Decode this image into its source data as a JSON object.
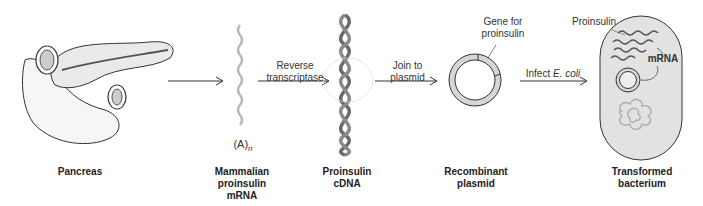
{
  "stages": [
    {
      "id": "pancreas",
      "label": "Pancreas"
    },
    {
      "id": "mrna",
      "label_lines": [
        "Mammalian",
        "proinsulin",
        "mRNA"
      ],
      "tail_label": "(A)",
      "tail_subscript": "n"
    },
    {
      "id": "cdna",
      "label_lines": [
        "Proinsulin",
        "cDNA"
      ]
    },
    {
      "id": "plasmid",
      "label_lines": [
        "Recombinant",
        "plasmid"
      ],
      "callout_lines": [
        "Gene for",
        "proinsulin"
      ]
    },
    {
      "id": "bacterium",
      "label_lines": [
        "Transformed",
        "bacterium"
      ],
      "callout_proinsulin": "Proinsulin",
      "callout_mrna": "mRNA"
    }
  ],
  "arrows": [
    {
      "from": "pancreas",
      "to": "mrna",
      "label_lines": []
    },
    {
      "from": "mrna",
      "to": "cdna",
      "label_lines": [
        "Reverse",
        "transcriptase"
      ]
    },
    {
      "from": "cdna",
      "to": "plasmid",
      "label_lines": [
        "Join to",
        "plasmid"
      ]
    },
    {
      "from": "plasmid",
      "to": "bacterium",
      "label_prefix": "Infect ",
      "label_italic": "E. coli"
    }
  ],
  "colors": {
    "line": "#333333",
    "plasmid_fill": "#d6d6d6",
    "bacterium_fill": "#e2e2e2",
    "helix": "#6a6a6a",
    "mrna_strand": "#b8b8b8"
  }
}
